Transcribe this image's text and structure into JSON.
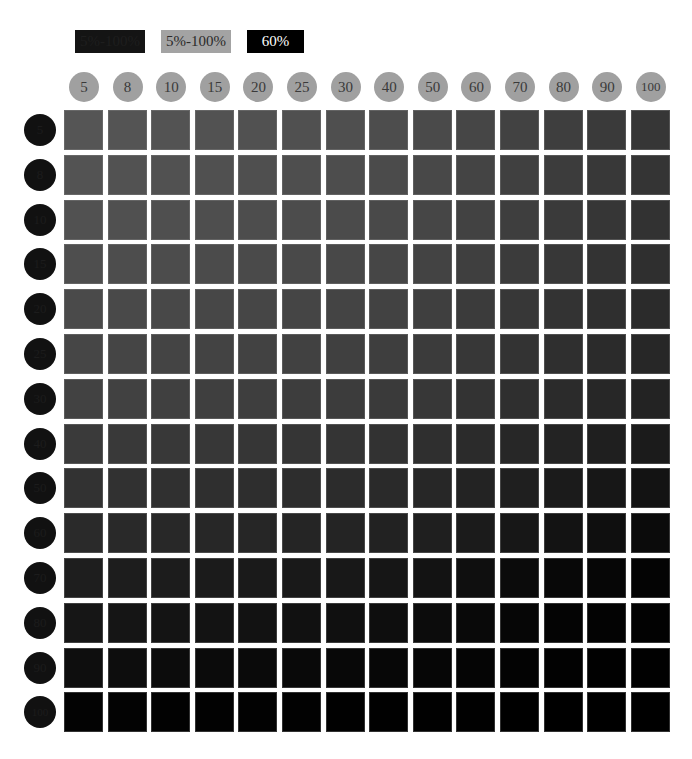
{
  "legend": [
    {
      "label": "5%-100%",
      "bg": "#141414",
      "fg": "#1e1e1e"
    },
    {
      "label": "5%-100%",
      "bg": "#a3a3a3",
      "fg": "#2a2a2a"
    },
    {
      "label": "60%",
      "bg": "#000000",
      "fg": "#ffffff"
    }
  ],
  "columns": [
    "5",
    "8",
    "10",
    "15",
    "20",
    "25",
    "30",
    "40",
    "50",
    "60",
    "70",
    "80",
    "90",
    "100"
  ],
  "rows": [
    "5",
    "8",
    "10",
    "15",
    "20",
    "25",
    "30",
    "40",
    "50",
    "60",
    "70",
    "80",
    "90",
    "100"
  ],
  "colors": {
    "column_header_bg": "#a0a0a0",
    "column_header_text": "#3a3a3a",
    "row_header_bg": "#111111",
    "row_header_text": "#1c1c1c",
    "background": "#ffffff"
  },
  "chart_data": {
    "type": "heatmap",
    "title": "",
    "xlabel": "",
    "ylabel": "",
    "x": [
      "5",
      "8",
      "10",
      "15",
      "20",
      "25",
      "30",
      "40",
      "50",
      "60",
      "70",
      "80",
      "90",
      "100"
    ],
    "y": [
      "5",
      "8",
      "10",
      "15",
      "20",
      "25",
      "30",
      "40",
      "50",
      "60",
      "70",
      "80",
      "90",
      "100"
    ],
    "value_description": "gray level (0=black, 255=white) of each swatch",
    "values": [
      [
        85,
        84,
        83,
        82,
        81,
        80,
        79,
        77,
        74,
        70,
        66,
        62,
        58,
        54
      ],
      [
        83,
        82,
        81,
        80,
        79,
        78,
        77,
        75,
        72,
        68,
        64,
        60,
        56,
        52
      ],
      [
        81,
        80,
        79,
        78,
        77,
        76,
        75,
        73,
        70,
        66,
        62,
        58,
        54,
        50
      ],
      [
        78,
        77,
        76,
        75,
        74,
        73,
        72,
        70,
        67,
        63,
        59,
        55,
        51,
        47
      ],
      [
        74,
        73,
        72,
        71,
        70,
        69,
        68,
        66,
        63,
        59,
        55,
        51,
        47,
        43
      ],
      [
        70,
        69,
        68,
        67,
        66,
        65,
        64,
        62,
        59,
        55,
        51,
        47,
        43,
        39
      ],
      [
        66,
        65,
        64,
        63,
        62,
        61,
        60,
        58,
        55,
        51,
        47,
        43,
        39,
        35
      ],
      [
        58,
        57,
        56,
        55,
        54,
        53,
        52,
        50,
        47,
        43,
        39,
        35,
        31,
        27
      ],
      [
        50,
        49,
        48,
        47,
        46,
        45,
        44,
        42,
        39,
        35,
        31,
        27,
        23,
        19
      ],
      [
        42,
        41,
        40,
        39,
        38,
        37,
        36,
        34,
        31,
        27,
        23,
        19,
        15,
        11
      ],
      [
        30,
        29,
        28,
        27,
        26,
        25,
        24,
        22,
        19,
        15,
        11,
        8,
        6,
        4
      ],
      [
        22,
        21,
        20,
        19,
        18,
        17,
        16,
        14,
        12,
        9,
        6,
        4,
        3,
        2
      ],
      [
        14,
        13,
        12,
        11,
        10,
        9,
        8,
        7,
        6,
        5,
        3,
        2,
        1,
        1
      ],
      [
        3,
        3,
        2,
        2,
        2,
        2,
        1,
        1,
        1,
        1,
        0,
        0,
        0,
        0
      ]
    ],
    "colorscale": "grayscale, darker toward bottom-right",
    "legend": [
      "5%-100%",
      "5%-100%",
      "60%"
    ]
  }
}
